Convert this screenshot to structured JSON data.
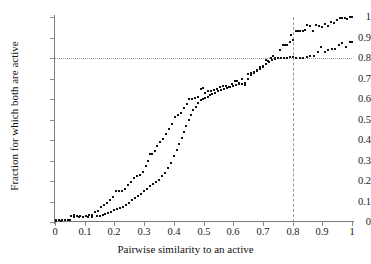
{
  "chart_data": {
    "type": "scatter",
    "title": "",
    "xlabel": "Pairwise similarity to an active",
    "ylabel": "Fraction for which both are active",
    "xlim": [
      0,
      1
    ],
    "ylim": [
      0,
      1
    ],
    "xticks": [
      "0",
      "0.1",
      "0.2",
      "0.3",
      "0.4",
      "0.5",
      "0.6",
      "0.7",
      "0.8",
      "0.9",
      "1"
    ],
    "yticks": [
      "0",
      "0.1",
      "0.2",
      "0.3",
      "0.4",
      "0.5",
      "0.6",
      "0.7",
      "0.8",
      "0.9",
      "1"
    ],
    "xtick_values": [
      0,
      0.1,
      0.2,
      0.3,
      0.4,
      0.5,
      0.6,
      0.7,
      0.8,
      0.9,
      1
    ],
    "ytick_values": [
      0,
      0.1,
      0.2,
      0.3,
      0.4,
      0.5,
      0.6,
      0.7,
      0.8,
      0.9,
      1
    ],
    "grid": false,
    "legend": null,
    "marker": {
      "shape": "square",
      "size_px": 2,
      "color": "#111111"
    },
    "reference_lines": [
      {
        "name": "horizontal-threshold",
        "orientation": "horizontal",
        "value": 0.8,
        "style": "dotted",
        "color": "#9a9a9a"
      },
      {
        "name": "vertical-threshold",
        "orientation": "vertical",
        "value": 0.8,
        "style": "dashed",
        "color": "#9a9a9a"
      }
    ],
    "series": [
      {
        "name": "upper-curve",
        "points": [
          [
            0.005,
            0.008
          ],
          [
            0.015,
            0.008
          ],
          [
            0.025,
            0.01
          ],
          [
            0.035,
            0.01
          ],
          [
            0.045,
            0.012
          ],
          [
            0.055,
            0.03
          ],
          [
            0.065,
            0.032
          ],
          [
            0.075,
            0.03
          ],
          [
            0.085,
            0.028
          ],
          [
            0.095,
            0.026
          ],
          [
            0.105,
            0.03
          ],
          [
            0.115,
            0.032
          ],
          [
            0.125,
            0.034
          ],
          [
            0.135,
            0.05
          ],
          [
            0.145,
            0.055
          ],
          [
            0.155,
            0.075
          ],
          [
            0.165,
            0.085
          ],
          [
            0.175,
            0.095
          ],
          [
            0.185,
            0.105
          ],
          [
            0.195,
            0.12
          ],
          [
            0.205,
            0.15
          ],
          [
            0.215,
            0.15
          ],
          [
            0.225,
            0.152
          ],
          [
            0.235,
            0.16
          ],
          [
            0.245,
            0.18
          ],
          [
            0.255,
            0.195
          ],
          [
            0.265,
            0.215
          ],
          [
            0.275,
            0.225
          ],
          [
            0.285,
            0.23
          ],
          [
            0.295,
            0.245
          ],
          [
            0.305,
            0.275
          ],
          [
            0.312,
            0.3
          ],
          [
            0.32,
            0.33
          ],
          [
            0.328,
            0.33
          ],
          [
            0.336,
            0.345
          ],
          [
            0.345,
            0.37
          ],
          [
            0.355,
            0.39
          ],
          [
            0.365,
            0.405
          ],
          [
            0.375,
            0.43
          ],
          [
            0.385,
            0.455
          ],
          [
            0.395,
            0.48
          ],
          [
            0.405,
            0.51
          ],
          [
            0.415,
            0.52
          ],
          [
            0.425,
            0.53
          ],
          [
            0.435,
            0.555
          ],
          [
            0.445,
            0.575
          ],
          [
            0.452,
            0.6
          ],
          [
            0.46,
            0.6
          ],
          [
            0.47,
            0.605
          ],
          [
            0.48,
            0.61
          ],
          [
            0.49,
            0.65
          ],
          [
            0.497,
            0.655
          ],
          [
            0.505,
            0.63
          ],
          [
            0.515,
            0.64
          ],
          [
            0.525,
            0.64
          ],
          [
            0.535,
            0.645
          ],
          [
            0.545,
            0.65
          ],
          [
            0.555,
            0.66
          ],
          [
            0.565,
            0.665
          ],
          [
            0.575,
            0.665
          ],
          [
            0.585,
            0.66
          ],
          [
            0.595,
            0.672
          ],
          [
            0.605,
            0.69
          ],
          [
            0.612,
            0.69
          ],
          [
            0.62,
            0.68
          ],
          [
            0.63,
            0.7
          ],
          [
            0.64,
            0.67
          ],
          [
            0.65,
            0.72
          ],
          [
            0.66,
            0.725
          ],
          [
            0.67,
            0.73
          ],
          [
            0.68,
            0.74
          ],
          [
            0.69,
            0.755
          ],
          [
            0.7,
            0.76
          ],
          [
            0.71,
            0.79
          ],
          [
            0.718,
            0.785
          ],
          [
            0.726,
            0.8
          ],
          [
            0.734,
            0.81
          ],
          [
            0.742,
            0.8
          ],
          [
            0.75,
            0.8
          ],
          [
            0.758,
            0.84
          ],
          [
            0.766,
            0.865
          ],
          [
            0.774,
            0.865
          ],
          [
            0.782,
            0.865
          ],
          [
            0.79,
            0.88
          ],
          [
            0.796,
            0.91
          ],
          [
            0.802,
            0.89
          ],
          [
            0.81,
            0.93
          ],
          [
            0.818,
            0.93
          ],
          [
            0.826,
            0.93
          ],
          [
            0.834,
            0.93
          ],
          [
            0.842,
            0.935
          ],
          [
            0.85,
            0.96
          ],
          [
            0.86,
            0.955
          ],
          [
            0.87,
            0.93
          ],
          [
            0.88,
            0.96
          ],
          [
            0.89,
            0.955
          ],
          [
            0.9,
            0.95
          ],
          [
            0.91,
            0.965
          ],
          [
            0.92,
            0.955
          ],
          [
            0.93,
            0.975
          ],
          [
            0.94,
            0.97
          ],
          [
            0.95,
            0.985
          ],
          [
            0.96,
            0.995
          ],
          [
            0.968,
            0.995
          ],
          [
            0.976,
            0.995
          ],
          [
            0.984,
            0.99
          ],
          [
            0.992,
            1.0
          ],
          [
            1.0,
            1.0
          ]
        ]
      },
      {
        "name": "lower-curve",
        "points": [
          [
            0.005,
            0.006
          ],
          [
            0.02,
            0.006
          ],
          [
            0.035,
            0.008
          ],
          [
            0.05,
            0.01
          ],
          [
            0.065,
            0.026
          ],
          [
            0.08,
            0.024
          ],
          [
            0.095,
            0.022
          ],
          [
            0.11,
            0.024
          ],
          [
            0.125,
            0.026
          ],
          [
            0.14,
            0.028
          ],
          [
            0.15,
            0.03
          ],
          [
            0.16,
            0.035
          ],
          [
            0.17,
            0.04
          ],
          [
            0.18,
            0.045
          ],
          [
            0.19,
            0.05
          ],
          [
            0.2,
            0.058
          ],
          [
            0.21,
            0.062
          ],
          [
            0.22,
            0.07
          ],
          [
            0.23,
            0.075
          ],
          [
            0.24,
            0.085
          ],
          [
            0.25,
            0.095
          ],
          [
            0.26,
            0.105
          ],
          [
            0.27,
            0.115
          ],
          [
            0.28,
            0.125
          ],
          [
            0.29,
            0.135
          ],
          [
            0.3,
            0.15
          ],
          [
            0.31,
            0.16
          ],
          [
            0.32,
            0.175
          ],
          [
            0.33,
            0.185
          ],
          [
            0.34,
            0.195
          ],
          [
            0.35,
            0.205
          ],
          [
            0.36,
            0.225
          ],
          [
            0.37,
            0.24
          ],
          [
            0.38,
            0.265
          ],
          [
            0.39,
            0.29
          ],
          [
            0.4,
            0.32
          ],
          [
            0.41,
            0.35
          ],
          [
            0.418,
            0.38
          ],
          [
            0.426,
            0.41
          ],
          [
            0.434,
            0.44
          ],
          [
            0.442,
            0.47
          ],
          [
            0.45,
            0.5
          ],
          [
            0.458,
            0.52
          ],
          [
            0.466,
            0.545
          ],
          [
            0.474,
            0.56
          ],
          [
            0.482,
            0.58
          ],
          [
            0.49,
            0.595
          ],
          [
            0.498,
            0.6
          ],
          [
            0.506,
            0.605
          ],
          [
            0.514,
            0.612
          ],
          [
            0.522,
            0.62
          ],
          [
            0.53,
            0.625
          ],
          [
            0.54,
            0.63
          ],
          [
            0.55,
            0.64
          ],
          [
            0.56,
            0.645
          ],
          [
            0.57,
            0.65
          ],
          [
            0.58,
            0.655
          ],
          [
            0.59,
            0.66
          ],
          [
            0.6,
            0.665
          ],
          [
            0.61,
            0.67
          ],
          [
            0.62,
            0.672
          ],
          [
            0.63,
            0.675
          ],
          [
            0.64,
            0.68
          ],
          [
            0.65,
            0.7
          ],
          [
            0.66,
            0.715
          ],
          [
            0.67,
            0.725
          ],
          [
            0.68,
            0.735
          ],
          [
            0.69,
            0.745
          ],
          [
            0.7,
            0.755
          ],
          [
            0.71,
            0.77
          ],
          [
            0.72,
            0.78
          ],
          [
            0.73,
            0.79
          ],
          [
            0.74,
            0.795
          ],
          [
            0.75,
            0.8
          ],
          [
            0.76,
            0.8
          ],
          [
            0.77,
            0.8
          ],
          [
            0.78,
            0.802
          ],
          [
            0.79,
            0.805
          ],
          [
            0.8,
            0.805
          ],
          [
            0.812,
            0.8
          ],
          [
            0.824,
            0.8
          ],
          [
            0.836,
            0.8
          ],
          [
            0.848,
            0.805
          ],
          [
            0.86,
            0.81
          ],
          [
            0.872,
            0.81
          ],
          [
            0.884,
            0.83
          ],
          [
            0.896,
            0.855
          ],
          [
            0.908,
            0.83
          ],
          [
            0.92,
            0.84
          ],
          [
            0.932,
            0.845
          ],
          [
            0.944,
            0.845
          ],
          [
            0.956,
            0.865
          ],
          [
            0.968,
            0.875
          ],
          [
            0.98,
            0.855
          ],
          [
            0.992,
            0.88
          ],
          [
            1.0,
            0.88
          ]
        ]
      }
    ]
  }
}
